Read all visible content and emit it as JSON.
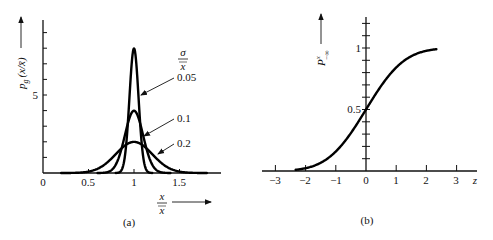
{
  "chart_data": [
    {
      "panel": "(a)",
      "type": "line",
      "title": "",
      "xlabel": "x / x̄",
      "ylabel": "p_g(x/x̄)",
      "legend_title": "σ / x̄",
      "xlim": [
        0,
        1.95
      ],
      "ylim": [
        0,
        10
      ],
      "x_ticks": [
        0,
        0.5,
        1,
        1.5
      ],
      "x_tick_labels": [
        "0",
        "0.5",
        "1",
        "1.5"
      ],
      "y_ticks": [
        0,
        1,
        2,
        3,
        4,
        5,
        6,
        7,
        8,
        9,
        10
      ],
      "y_tick_labels": [
        "5"
      ],
      "y_labeled_tick": 5,
      "grid": false,
      "series": [
        {
          "name": "0.05",
          "sigma": 0.05,
          "mean": 1,
          "peak": 7.98
        },
        {
          "name": "0.1",
          "sigma": 0.1,
          "mean": 1,
          "peak": 3.99
        },
        {
          "name": "0.2",
          "sigma": 0.2,
          "mean": 1,
          "peak": 1.99
        }
      ],
      "annotations": [
        "0.05",
        "0.1",
        "0.2"
      ]
    },
    {
      "panel": "(b)",
      "type": "line",
      "title": "",
      "xlabel": "z",
      "ylabel": "P^x_{-∞}",
      "xlim": [
        -3.5,
        3.7
      ],
      "ylim": [
        0,
        1.25
      ],
      "x_ticks": [
        -3,
        -2,
        -1,
        0,
        1,
        2,
        3
      ],
      "x_tick_labels": [
        "−3",
        "−2",
        "−1",
        "0",
        "1",
        "2",
        "3"
      ],
      "y_ticks": [
        0,
        0.1,
        0.2,
        0.3,
        0.4,
        0.5,
        0.6,
        0.7,
        0.8,
        0.9,
        1.0,
        1.1,
        1.2
      ],
      "y_tick_labels": [
        "0.5",
        "1"
      ],
      "grid": false,
      "series": [
        {
          "name": "cumulative normal",
          "z_start": -2.33,
          "z_end": 2.33,
          "points": [
            [
              -2.33,
              0.01
            ],
            [
              -2,
              0.023
            ],
            [
              -1.5,
              0.067
            ],
            [
              -1,
              0.159
            ],
            [
              -0.5,
              0.309
            ],
            [
              0,
              0.5
            ],
            [
              0.5,
              0.691
            ],
            [
              1,
              0.841
            ],
            [
              1.5,
              0.933
            ],
            [
              2,
              0.977
            ],
            [
              2.33,
              0.99
            ]
          ]
        }
      ]
    }
  ],
  "panel_a": {
    "caption": "(a)",
    "ylabel_main": "p",
    "ylabel_sub": "g",
    "ylabel_arg": "(x/x̄)",
    "xlabel_num": "x",
    "xlabel_den": "x",
    "legend_num": "σ",
    "legend_den": "x",
    "tick_0": "0",
    "tick_05": "0.5",
    "tick_1": "1",
    "tick_15": "1.5",
    "tick_y5": "5",
    "label_005": "0.05",
    "label_01": "0.1",
    "label_02": "0.2"
  },
  "panel_b": {
    "caption": "(b)",
    "ylabel_main": "P",
    "ylabel_sup": "x",
    "ylabel_sub": "−∞",
    "xlabel": "z",
    "tick_m3": "−3",
    "tick_m2": "−2",
    "tick_m1": "−1",
    "tick_0": "0",
    "tick_1": "1",
    "tick_2": "2",
    "tick_3": "3",
    "tick_y05": "0.5",
    "tick_y1": "1"
  }
}
